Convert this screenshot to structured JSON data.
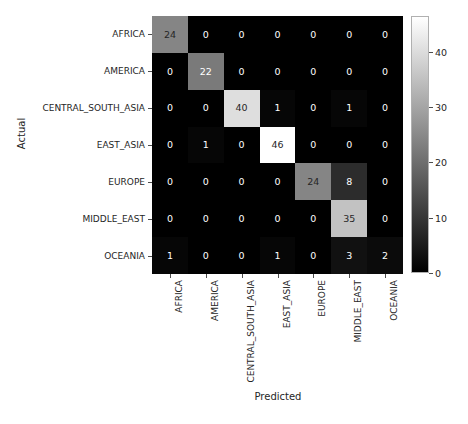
{
  "chart_data": {
    "type": "heatmap",
    "title": "",
    "xlabel": "Predicted",
    "ylabel": "Actual",
    "grid": false,
    "legend_position": "right-colorbar",
    "colormap": "gray",
    "x_categories": [
      "AFRICA",
      "AMERICA",
      "CENTRAL_SOUTH_ASIA",
      "EAST_ASIA",
      "EUROPE",
      "MIDDLE_EAST",
      "OCEANIA"
    ],
    "y_categories": [
      "AFRICA",
      "AMERICA",
      "CENTRAL_SOUTH_ASIA",
      "EAST_ASIA",
      "EUROPE",
      "MIDDLE_EAST",
      "OCEANIA"
    ],
    "values": [
      [
        24,
        0,
        0,
        0,
        0,
        0,
        0
      ],
      [
        0,
        22,
        0,
        0,
        0,
        0,
        0
      ],
      [
        0,
        0,
        40,
        1,
        0,
        1,
        0
      ],
      [
        0,
        1,
        0,
        46,
        0,
        0,
        0
      ],
      [
        0,
        0,
        0,
        0,
        24,
        8,
        0
      ],
      [
        0,
        0,
        0,
        0,
        0,
        35,
        0
      ],
      [
        1,
        0,
        0,
        1,
        0,
        3,
        2
      ]
    ],
    "vmin": 0,
    "vmax": 46,
    "colorbar": {
      "ticks": [
        0,
        10,
        20,
        30,
        40
      ],
      "tick_labels": [
        "0",
        "10",
        "20",
        "30",
        "40"
      ],
      "min": 0,
      "max": 46.5
    }
  },
  "axes": {
    "xlabel": "Predicted",
    "ylabel": "Actual"
  },
  "colors": {
    "text": "#262626",
    "cell_text_light": "#ffffff",
    "cell_text_dark": "#262626",
    "tick": "#4d4d4d",
    "background": "#ffffff"
  }
}
